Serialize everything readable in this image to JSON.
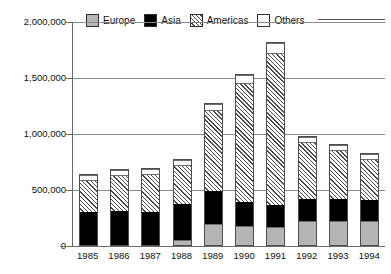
{
  "chart_data": {
    "type": "bar",
    "subtype": "stacked-bar",
    "title": "",
    "xlabel": "",
    "ylabel": "",
    "ylim": [
      0,
      2000000
    ],
    "yticks": [
      0,
      500000,
      1000000,
      1500000,
      2000000
    ],
    "ytick_labels": [
      "0",
      "500,000",
      "1,000,000",
      "1,500,000",
      "2,000,000"
    ],
    "grid": true,
    "legend_position": "top",
    "categories": [
      "1985",
      "1986",
      "1987",
      "1988",
      "1989",
      "1990",
      "1991",
      "1992",
      "1993",
      "1994"
    ],
    "series": [
      {
        "name": "Europe",
        "color": "#b5b5b5",
        "pattern": "solid-grey",
        "values": [
          0,
          0,
          0,
          45000,
          190000,
          170000,
          160000,
          215000,
          215000,
          215000
        ]
      },
      {
        "name": "Asia",
        "color": "#000000",
        "pattern": "solid-black",
        "values": [
          300000,
          315000,
          300000,
          330000,
          300000,
          215000,
          205000,
          205000,
          205000,
          195000
        ]
      },
      {
        "name": "Americas",
        "color": "#ffffff",
        "pattern": "diagonal-hatch",
        "values": [
          300000,
          330000,
          350000,
          360000,
          735000,
          1080000,
          1365000,
          520000,
          445000,
          375000
        ]
      },
      {
        "name": "Others",
        "color": "#ffffff",
        "pattern": "open-white",
        "values": [
          45000,
          45000,
          50000,
          45000,
          50000,
          70000,
          90000,
          40000,
          45000,
          45000
        ]
      }
    ],
    "totals": [
      645000,
      690000,
      700000,
      780000,
      1275000,
      1535000,
      1820000,
      980000,
      910000,
      830000
    ]
  },
  "legend": {
    "items": [
      {
        "label": "Europe",
        "swatch": "europe"
      },
      {
        "label": "Asia",
        "swatch": "asia"
      },
      {
        "label": "Americas",
        "swatch": "americas"
      },
      {
        "label": "Others",
        "swatch": "others"
      }
    ]
  }
}
